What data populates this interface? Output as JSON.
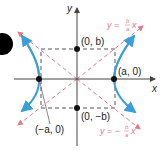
{
  "diagram": {
    "axes": {
      "x_label": "x",
      "y_label": "y"
    },
    "points": [
      {
        "id": "left-vertex",
        "label": "(−a, 0)"
      },
      {
        "id": "right-vertex",
        "label": "(a, 0)"
      },
      {
        "id": "top-covertex",
        "label": "(0, b)"
      },
      {
        "id": "bottom-covertex",
        "label": "(0, −b)"
      }
    ],
    "asymptotes": [
      {
        "id": "positive",
        "label": "y = (b/a)x",
        "lhs": "y = ",
        "num": "b",
        "den": "a",
        "var": "x"
      },
      {
        "id": "negative",
        "label": "y = −(b/a)x",
        "lhs": "y = −",
        "num": "b",
        "den": "a",
        "var": "x"
      }
    ],
    "colors": {
      "curve": "#3a9fd8",
      "asymptote": "#e07a8c",
      "axis": "#444444",
      "box": "#444444",
      "point": "#111111"
    }
  }
}
